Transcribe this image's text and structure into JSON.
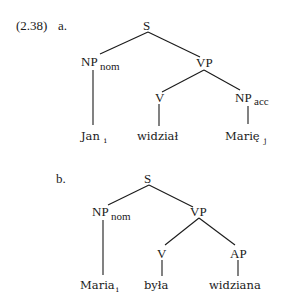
{
  "example": {
    "number": "(2.38)",
    "trees": [
      {
        "label": "a.",
        "root": "S",
        "np_subject": {
          "cat": "NP",
          "sub": "nom"
        },
        "vp": "VP",
        "v": "V",
        "complement": {
          "cat": "NP",
          "sub": "acc"
        },
        "leaves": [
          {
            "word": "Jan",
            "index": "i"
          },
          {
            "word": "widział",
            "index": ""
          },
          {
            "word": "Marię",
            "index": "j"
          }
        ]
      },
      {
        "label": "b.",
        "root": "S",
        "np_subject": {
          "cat": "NP",
          "sub": "nom"
        },
        "vp": "VP",
        "v": "V",
        "complement": {
          "cat": "AP",
          "sub": ""
        },
        "leaves": [
          {
            "word": "Maria",
            "index": "i"
          },
          {
            "word": "była",
            "index": ""
          },
          {
            "word": "widziana",
            "index": ""
          }
        ]
      }
    ]
  }
}
